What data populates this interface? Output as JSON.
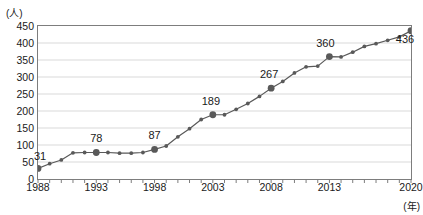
{
  "chart_data": {
    "type": "line",
    "title": "",
    "xlabel": "(年)",
    "ylabel": "(人)",
    "ylim": [
      0,
      450
    ],
    "ytick_step": 50,
    "yticks": [
      450,
      400,
      350,
      300,
      250,
      200,
      150,
      100,
      50,
      0
    ],
    "xlim": [
      1988,
      2020
    ],
    "xticks": [
      1988,
      1993,
      1998,
      2003,
      2008,
      2013,
      2020
    ],
    "grid": "horizontal",
    "legend": "none",
    "line_color": "#595959",
    "marker_color": "#595959",
    "gridline_color": "#d9d9d9",
    "axis_color": "#7d7d7d",
    "x": [
      1988,
      1989,
      1990,
      1991,
      1992,
      1993,
      1994,
      1995,
      1996,
      1997,
      1998,
      1999,
      2000,
      2001,
      2002,
      2003,
      2004,
      2005,
      2006,
      2007,
      2008,
      2009,
      2010,
      2011,
      2012,
      2013,
      2014,
      2015,
      2016,
      2017,
      2018,
      2019,
      2020
    ],
    "values": [
      31,
      45,
      56,
      77,
      78,
      78,
      78,
      76,
      76,
      78,
      87,
      97,
      124,
      148,
      175,
      189,
      189,
      205,
      222,
      243,
      267,
      287,
      312,
      330,
      332,
      360,
      359,
      373,
      390,
      398,
      408,
      418,
      436
    ],
    "annotated_points": [
      {
        "x": 1988,
        "y": 31,
        "label": "31"
      },
      {
        "x": 1993,
        "y": 78,
        "label": "78"
      },
      {
        "x": 1998,
        "y": 87,
        "label": "87"
      },
      {
        "x": 2003,
        "y": 189,
        "label": "189"
      },
      {
        "x": 2008,
        "y": 267,
        "label": "267"
      },
      {
        "x": 2013,
        "y": 360,
        "label": "360"
      },
      {
        "x": 2020,
        "y": 436,
        "label": "436"
      }
    ]
  }
}
